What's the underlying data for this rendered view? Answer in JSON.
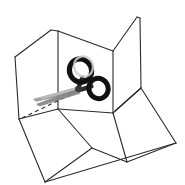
{
  "illustration": {
    "title": "Unfolded cardboard box with scissors cutting along a dashed fold line",
    "subject": "box-and-scissors-line-drawing",
    "style": "line-art",
    "background_color": "#ffffff",
    "outline_color": "#2b2b2b",
    "outline_width": 1.1,
    "scissors": {
      "name": "scissors",
      "handle_color": "#111111",
      "blade_color": "#8d8d8d",
      "blade_highlight_color": "#b8b8b8",
      "pivot_color": "#3a3a3a",
      "rings": [
        {
          "name": "upper-left-ring",
          "cx": 80.5,
          "cy": 70.5,
          "rx": 11.0,
          "ry": 11.8,
          "rotate": -22,
          "stroke_width": 5.2
        },
        {
          "name": "lower-right-ring",
          "cx": 98.5,
          "cy": 88.5,
          "rx": 9.6,
          "ry": 10.2,
          "rotate": -22,
          "stroke_width": 5.0
        }
      ],
      "pivot": {
        "cx": 78.0,
        "cy": 89.0,
        "r": 3.0
      },
      "blade_tip": {
        "x": 33.0,
        "y": 99.0
      }
    },
    "cut_line": {
      "name": "cut-fold-dashed-line",
      "color": "#2b2b2b",
      "dash": "4 3.2",
      "width": 1.1,
      "from": {
        "x": 22.0,
        "y": 118.0
      },
      "to": {
        "x": 72.0,
        "y": 94.0
      }
    },
    "panels": [
      {
        "name": "left-upright-flap",
        "points": "15,57 51,30 57,31 58,109 19,119"
      },
      {
        "name": "center-back-upright-panel",
        "points": "58,31 113,51 113,113 58,109"
      },
      {
        "name": "right-upright-flap",
        "points": "113,51 137,17 140,18 141,88 115,111"
      },
      {
        "name": "bottom-left-base-panel",
        "points": "19,119 58,109 92,148 45,182"
      },
      {
        "name": "bottom-center-base-panel",
        "points": "58,109 113,113 127,162 92,148"
      },
      {
        "name": "bottom-right-base-panel",
        "points": "115,111 141,88 176,143 127,162"
      },
      {
        "name": "bottom-front-base-edge",
        "points": "45,182 92,148 127,162 176,143"
      }
    ],
    "edges": [
      {
        "name": "edge-left-flap-top",
        "from": {
          "x": 15,
          "y": 57
        },
        "to": {
          "x": 51,
          "y": 30
        }
      },
      {
        "name": "edge-left-flap-crease",
        "from": {
          "x": 51,
          "y": 30
        },
        "to": {
          "x": 58,
          "y": 31
        }
      },
      {
        "name": "edge-left-flap-outer",
        "from": {
          "x": 15,
          "y": 57
        },
        "to": {
          "x": 19,
          "y": 119
        }
      },
      {
        "name": "edge-center-top",
        "from": {
          "x": 58,
          "y": 31
        },
        "to": {
          "x": 113,
          "y": 51
        }
      },
      {
        "name": "edge-center-left-fold",
        "from": {
          "x": 58,
          "y": 31
        },
        "to": {
          "x": 58,
          "y": 109
        }
      },
      {
        "name": "edge-center-right-fold",
        "from": {
          "x": 113,
          "y": 51
        },
        "to": {
          "x": 113,
          "y": 113
        }
      },
      {
        "name": "edge-right-flap-top",
        "from": {
          "x": 113,
          "y": 51
        },
        "to": {
          "x": 137,
          "y": 17
        }
      },
      {
        "name": "edge-right-flap-crease",
        "from": {
          "x": 137,
          "y": 17
        },
        "to": {
          "x": 140,
          "y": 18
        }
      },
      {
        "name": "edge-right-flap-outer",
        "from": {
          "x": 140,
          "y": 18
        },
        "to": {
          "x": 141,
          "y": 88
        }
      },
      {
        "name": "edge-right-flap-bottom",
        "from": {
          "x": 141,
          "y": 88
        },
        "to": {
          "x": 115,
          "y": 111
        }
      },
      {
        "name": "edge-base-left-fold",
        "from": {
          "x": 19,
          "y": 119
        },
        "to": {
          "x": 58,
          "y": 109
        }
      },
      {
        "name": "edge-base-center-fold",
        "from": {
          "x": 58,
          "y": 109
        },
        "to": {
          "x": 113,
          "y": 113
        }
      },
      {
        "name": "edge-base-right-fold",
        "from": {
          "x": 113,
          "y": 113
        },
        "to": {
          "x": 141,
          "y": 88
        }
      },
      {
        "name": "edge-base-left-outer",
        "from": {
          "x": 19,
          "y": 119
        },
        "to": {
          "x": 45,
          "y": 182
        }
      },
      {
        "name": "edge-base-front-left",
        "from": {
          "x": 45,
          "y": 182
        },
        "to": {
          "x": 92,
          "y": 148
        }
      },
      {
        "name": "edge-base-front-mid",
        "from": {
          "x": 92,
          "y": 148
        },
        "to": {
          "x": 127,
          "y": 162
        }
      },
      {
        "name": "edge-base-front-right",
        "from": {
          "x": 127,
          "y": 162
        },
        "to": {
          "x": 176,
          "y": 143
        }
      },
      {
        "name": "edge-base-right-outer",
        "from": {
          "x": 141,
          "y": 88
        },
        "to": {
          "x": 176,
          "y": 143
        }
      },
      {
        "name": "edge-base-divider-left",
        "from": {
          "x": 58,
          "y": 109
        },
        "to": {
          "x": 92,
          "y": 148
        }
      },
      {
        "name": "edge-base-divider-right",
        "from": {
          "x": 113,
          "y": 113
        },
        "to": {
          "x": 127,
          "y": 162
        }
      },
      {
        "name": "edge-base-bottom-sweep",
        "from": {
          "x": 45,
          "y": 182
        },
        "to": {
          "x": 176,
          "y": 143
        }
      }
    ]
  }
}
